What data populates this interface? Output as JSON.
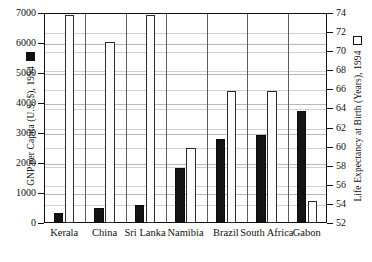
{
  "chart_data": {
    "type": "bar",
    "title": "",
    "subtitle": "",
    "xlabel": "",
    "categories": [
      "Kerala",
      "China",
      "Sri Lanka",
      "Namibia",
      "Brazil",
      "South Africa",
      "Gabon"
    ],
    "series": [
      {
        "name": "GNP per Capita (U.S. $), 1994",
        "axis": "left",
        "marker": "filled-square",
        "color": "#141414",
        "values": [
          340,
          500,
          600,
          1820,
          2800,
          2920,
          3750
        ]
      },
      {
        "name": "Life Expectancy at Birth (Years), 1994",
        "axis": "right",
        "marker": "hollow-square",
        "color": "#ffffff",
        "values": [
          73.8,
          71.0,
          73.8,
          59.9,
          65.8,
          65.8,
          54.3
        ]
      }
    ],
    "left_axis": {
      "label": "GNP per Capita (U.S. $), 1994",
      "legend_marker": "filled-square",
      "ylim": [
        0,
        7000
      ],
      "tick_step": 1000,
      "ticks": [
        "0",
        "1000",
        "2000",
        "3000",
        "4000",
        "5000",
        "6000",
        "7000"
      ],
      "tick_values": [
        0,
        1000,
        2000,
        3000,
        4000,
        5000,
        6000,
        7000
      ]
    },
    "right_axis": {
      "label": "Life Expectancy at Birth (Years), 1994",
      "legend_marker": "hollow-square",
      "ylim": [
        52,
        74
      ],
      "tick_step": 2,
      "ticks": [
        "52",
        "54",
        "56",
        "58",
        "60",
        "62",
        "64",
        "66",
        "68",
        "70",
        "72",
        "74"
      ],
      "tick_values": [
        52,
        54,
        56,
        58,
        60,
        62,
        64,
        66,
        68,
        70,
        72,
        74
      ]
    },
    "grid": true,
    "legend_position": "axis-titles",
    "colors": {
      "gnp_bar": "#141414",
      "life_bar": "#ffffff",
      "bar_outline": "#2b2b2b",
      "gridline": "#b9b9b9",
      "frame": "#111111",
      "background": "#ffffff"
    }
  }
}
